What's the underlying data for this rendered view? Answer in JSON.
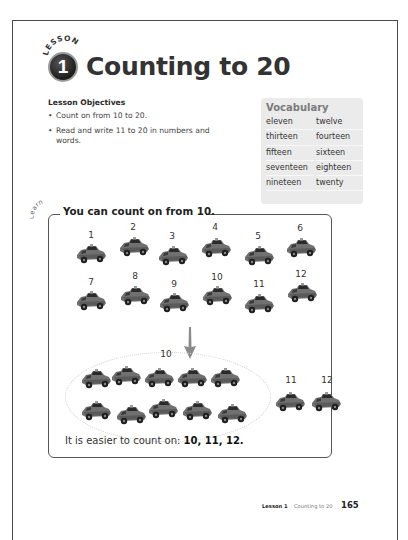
{
  "header": {
    "lesson_word": "LESSON",
    "lesson_number": "1",
    "title": "Counting to 20"
  },
  "objectives": {
    "heading": "Lesson Objectives",
    "items": [
      "Count on from 10 to 20.",
      "Read and write 11 to 20 in numbers and words."
    ]
  },
  "vocabulary": {
    "title": "Vocabulary",
    "words": [
      "eleven",
      "twelve",
      "thirteen",
      "fourteen",
      "fifteen",
      "sixteen",
      "seventeen",
      "eighteen",
      "nineteen",
      "twenty"
    ]
  },
  "learn": {
    "tag": "Learn",
    "heading": "You can count on from 10.",
    "row1_labels": [
      "1",
      "2",
      "3",
      "4",
      "5",
      "6"
    ],
    "row2_labels": [
      "7",
      "8",
      "9",
      "10",
      "11",
      "12"
    ],
    "group_label": "10",
    "extra_labels": [
      "11",
      "12"
    ],
    "sentence_prefix": "It is easier to count on: ",
    "sentence_bold": "10, 11, 12."
  },
  "footer": {
    "lesson": "Lesson 1",
    "title": "Counting to 20",
    "page": "165"
  },
  "colors": {
    "car": "#6e6e6e",
    "frame": "#555555",
    "vocab_bg": "#ebebeb",
    "arrow": "#8a8a8a"
  }
}
